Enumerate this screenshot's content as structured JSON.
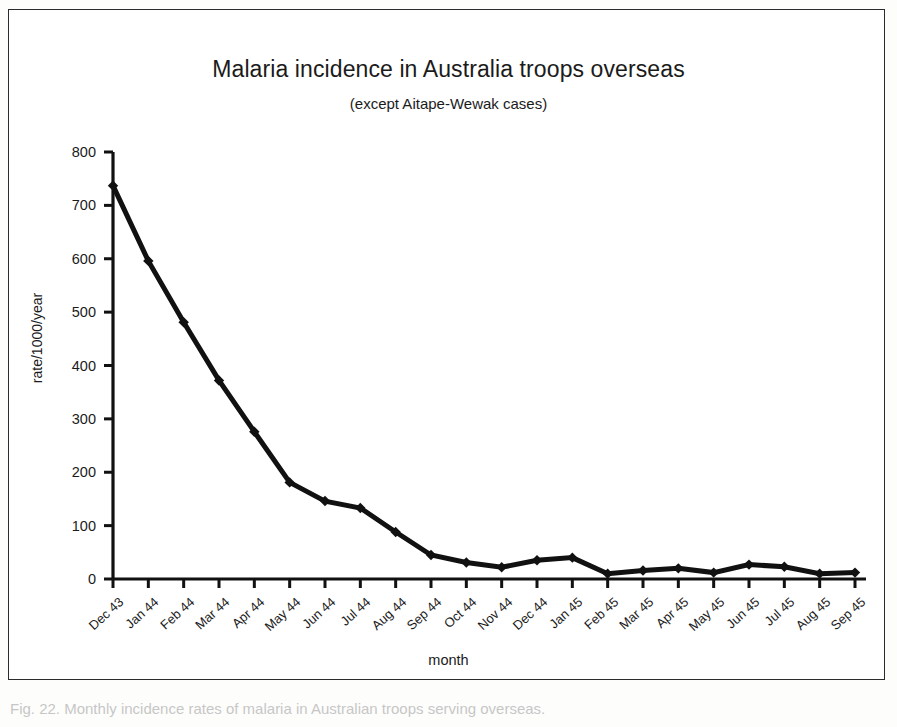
{
  "figure": {
    "title": "Malaria incidence in Australia troops overseas",
    "subtitle": "(except Aitape-Wewak cases)",
    "caption": "Fig. 22. Monthly incidence rates of malaria in Australian troops serving overseas."
  },
  "axes": {
    "y_title": "rate/1000/year",
    "x_title": "month",
    "y_ticks": [
      "0",
      "100",
      "200",
      "300",
      "400",
      "500",
      "600",
      "700",
      "800"
    ]
  },
  "chart_data": {
    "type": "line",
    "title": "Malaria incidence in Australia troops overseas",
    "subtitle": "(except Aitape-Wewak cases)",
    "xlabel": "month",
    "ylabel": "rate/1000/year",
    "ylim": [
      0,
      800
    ],
    "ytick_step": 100,
    "grid": false,
    "legend": "none",
    "marker": "diamond",
    "line_color": "#111111",
    "categories": [
      "Dec 43",
      "Jan 44",
      "Feb 44",
      "Mar 44",
      "Apr 44",
      "May 44",
      "Jun 44",
      "Jul 44",
      "Aug 44",
      "Sep 44",
      "Oct 44",
      "Nov 44",
      "Dec 44",
      "Jan 45",
      "Feb 45",
      "Mar 45",
      "Apr 45",
      "May 45",
      "Jun 45",
      "Jul 45",
      "Aug 45",
      "Sep 45"
    ],
    "values": [
      737,
      596,
      481,
      372,
      372,
      276,
      181,
      146,
      133,
      88,
      45,
      31,
      22,
      35,
      40,
      10,
      16,
      20,
      12,
      27,
      23,
      10
    ],
    "series": [
      {
        "name": "rate/1000/year",
        "values": [
          737,
          596,
          481,
          372,
          276,
          181,
          146,
          133,
          88,
          45,
          31,
          22,
          35,
          40,
          10,
          16,
          20,
          12,
          27,
          23,
          10,
          12
        ]
      }
    ]
  }
}
